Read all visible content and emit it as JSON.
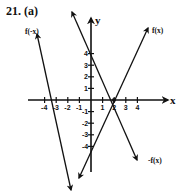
{
  "problem": {
    "label": "21. (a)"
  },
  "chart_data": {
    "type": "line",
    "title": "",
    "xlabel": "x",
    "ylabel": "y",
    "xlim": [
      -4.5,
      4.5
    ],
    "ylim": [
      -4.5,
      4.5
    ],
    "x_ticks": [
      -4,
      -3,
      -2,
      -1,
      1,
      2,
      3,
      4
    ],
    "x_tick_labels": [
      "-4",
      "-3",
      "-2",
      "-1",
      "1",
      "2",
      "3",
      "4"
    ],
    "y_ticks": [
      4,
      3,
      2,
      1,
      -1,
      -2,
      -3,
      -4
    ],
    "y_tick_labels": [
      "4",
      "3",
      "2",
      "1",
      "-1",
      "-2",
      "-3",
      "-4"
    ],
    "grid": false,
    "series": [
      {
        "name": "f(x)",
        "equation": "y = 2x - 4",
        "points": [
          [
            0,
            -4
          ],
          [
            2,
            0
          ]
        ]
      },
      {
        "name": "-f(x)",
        "equation": "y = -2x + 4",
        "points": [
          [
            0,
            4
          ],
          [
            2,
            0
          ]
        ]
      },
      {
        "name": "f(-x)",
        "equation": "y = -2x - 4",
        "points": [
          [
            -2,
            0
          ],
          [
            0,
            -4
          ]
        ]
      }
    ]
  },
  "labels": {
    "fx": "f(x)",
    "neg_fx": "-f(x)",
    "f_negx": "f(-x)",
    "x_axis": "x",
    "y_axis": "y"
  }
}
